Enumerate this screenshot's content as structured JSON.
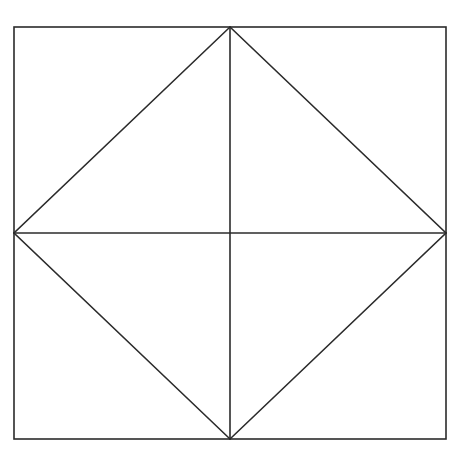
{
  "diagram": {
    "line_color": "#2b2b2b",
    "background": "#ffffff",
    "shapes": [
      "outer-square",
      "inscribed-diamond",
      "vertical-midline",
      "horizontal-midline"
    ]
  }
}
